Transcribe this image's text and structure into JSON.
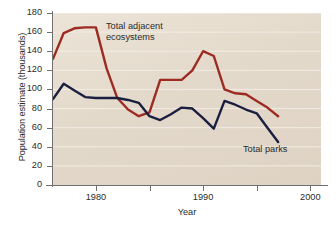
{
  "chart_data": {
    "type": "line",
    "title": "",
    "xlabel": "Year",
    "ylabel": "Population estimate (thousands)",
    "xlim": [
      1976,
      2001
    ],
    "ylim": [
      0,
      180
    ],
    "grid": "horizontal",
    "legend_position": "inline-annotations",
    "y_ticks": [
      0,
      20,
      40,
      60,
      80,
      100,
      120,
      140,
      160,
      180
    ],
    "y_tick_labels": [
      "0",
      "20",
      "40",
      "60",
      "80",
      "100",
      "120",
      "140",
      "160",
      "180"
    ],
    "x_ticks": [
      1980,
      1985,
      1990,
      1995,
      2000
    ],
    "x_tick_labels": [
      "1980",
      "",
      "1990",
      "",
      "2000"
    ],
    "x_major_labels": [
      "1980",
      "1990",
      "2000"
    ],
    "x": [
      1976,
      1977,
      1978,
      1979,
      1980,
      1981,
      1982,
      1983,
      1984,
      1985,
      1986,
      1987,
      1988,
      1989,
      1990,
      1991,
      1992,
      1993,
      1994,
      1995,
      1996,
      1997
    ],
    "series": [
      {
        "name": "Total adjacent ecosystems",
        "color": "#9e2b22",
        "annotation": "Total adjacent\necosystems",
        "values": [
          132,
          159,
          164,
          165,
          165,
          122,
          91,
          79,
          72,
          76,
          110,
          110,
          110,
          120,
          140,
          135,
          100,
          96,
          95,
          88,
          81,
          72
        ]
      },
      {
        "name": "Total parks",
        "color": "#1b1f3f",
        "annotation": "Total parks",
        "values": [
          90,
          106,
          99,
          92,
          91,
          91,
          91,
          89,
          86,
          72,
          68,
          74,
          81,
          80,
          70,
          59,
          88,
          84,
          79,
          75,
          60,
          45
        ]
      }
    ]
  },
  "colors": {
    "plot_background": "#e3d9cb",
    "gridline": "#f2ece3",
    "axis": "#6f6f6f",
    "text": "#2b2b2b",
    "ecosystems_line": "#9e2b22",
    "parks_line": "#1b1f3f"
  }
}
